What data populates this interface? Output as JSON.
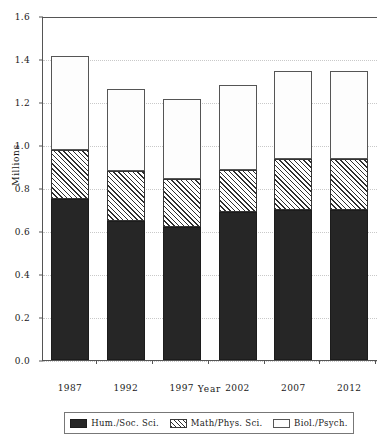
{
  "chart_data": {
    "type": "bar",
    "subtype": "stacked-bar",
    "title": "",
    "xlabel": "Year",
    "ylabel": "Millions",
    "categories": [
      "1987",
      "1992",
      "1997",
      "2002",
      "2007",
      "2012"
    ],
    "ylim": [
      0.0,
      1.6
    ],
    "ytick_labels": [
      "0.0",
      "0.2",
      "0.4",
      "0.6",
      "0.8",
      "1.0",
      "1.2",
      "1.4",
      "1.6"
    ],
    "ytick_values": [
      0.0,
      0.2,
      0.4,
      0.6,
      0.8,
      1.0,
      1.2,
      1.4,
      1.6
    ],
    "ytick_step": 0.2,
    "grid": true,
    "grid_axis": "y",
    "grid_style": "dotted",
    "legend_position": "bottom",
    "stack_order": [
      "Hum./Soc. Sci.",
      "Math/Phys. Sci.",
      "Biol./Psych."
    ],
    "series": [
      {
        "name": "Hum./Soc. Sci.",
        "pattern": "solid-dark",
        "color": "#262626",
        "values": [
          0.75,
          0.645,
          0.62,
          0.69,
          0.7,
          0.7
        ]
      },
      {
        "name": "Math/Phys. Sci.",
        "pattern": "diagonal-hatch",
        "color": "#2f2f2f",
        "values": [
          0.225,
          0.235,
          0.22,
          0.195,
          0.235,
          0.235
        ]
      },
      {
        "name": "Biol./Psych.",
        "pattern": "white-open",
        "color": "#fdfdfd",
        "values": [
          0.44,
          0.38,
          0.375,
          0.395,
          0.41,
          0.41
        ]
      }
    ],
    "cumulative_tops": {
      "Hum./Soc. Sci.": [
        0.75,
        0.645,
        0.62,
        0.69,
        0.7,
        0.7
      ],
      "Math/Phys. Sci.": [
        0.975,
        0.88,
        0.84,
        0.885,
        0.935,
        0.935
      ],
      "Biol./Psych.": [
        1.415,
        1.26,
        1.215,
        1.28,
        1.345,
        1.345
      ]
    },
    "totals": [
      1.415,
      1.26,
      1.215,
      1.28,
      1.345,
      1.345
    ]
  },
  "legend": {
    "entries": [
      {
        "label": "Hum./Soc. Sci."
      },
      {
        "label": "Math/Phys. Sci."
      },
      {
        "label": "Biol./Psych."
      }
    ]
  }
}
